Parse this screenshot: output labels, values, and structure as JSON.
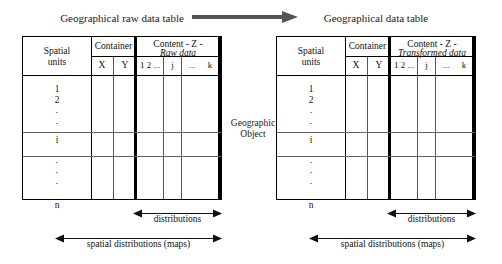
{
  "figure": {
    "transform_arrow_icon": "right-arrow-icon",
    "geographic_object": {
      "line1": "Geographic",
      "line2": "Object"
    }
  },
  "tables": [
    {
      "id": "raw",
      "title": "Geographical raw data table",
      "spatial_units": {
        "line1": "Spatial",
        "line2": "units"
      },
      "container_header": "Container",
      "container_columns": [
        "X",
        "Y"
      ],
      "content_header": "Content  -  Z  -",
      "content_subheader": "Raw data",
      "content_columns": [
        "1 2 ...",
        "j",
        "...",
        "k"
      ],
      "row_labels": [
        "1",
        "2",
        ".",
        ".",
        "i",
        ".",
        ".",
        ".",
        "",
        "n"
      ],
      "measures": [
        {
          "name": "distributions",
          "label": "distributions"
        },
        {
          "name": "spatial-distributions",
          "label": "spatial distributions  (maps)"
        }
      ]
    },
    {
      "id": "transformed",
      "title": "Geographical data table",
      "spatial_units": {
        "line1": "Spatial",
        "line2": "units"
      },
      "container_header": "Container",
      "container_columns": [
        "X",
        "Y"
      ],
      "content_header": "Content  -  Z  -",
      "content_subheader": "Transformed data",
      "content_columns": [
        "1 2 ...",
        "j",
        "...",
        "k"
      ],
      "row_labels": [
        "1",
        "2",
        ".",
        ".",
        "i",
        ".",
        ".",
        ".",
        "",
        "n"
      ],
      "measures": [
        {
          "name": "distributions",
          "label": "distributions"
        },
        {
          "name": "spatial-distributions",
          "label": "spatial distributions  (maps)"
        }
      ]
    }
  ],
  "colors": {
    "ink": "#111111",
    "rule": "#000000",
    "thin_rule": "#666666",
    "arrow_grey": "#555555",
    "background": "#ffffff"
  }
}
